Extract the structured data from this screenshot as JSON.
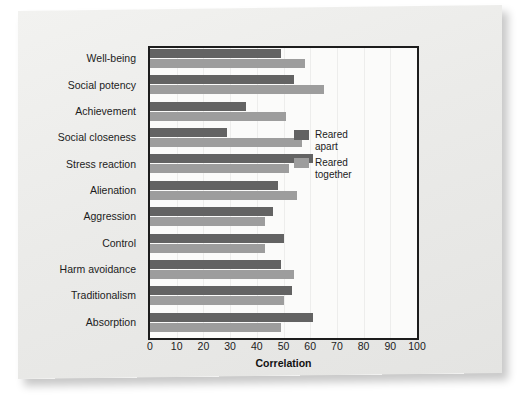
{
  "chart_data": {
    "type": "bar",
    "orientation": "horizontal",
    "title": "",
    "xlabel": "Correlation",
    "ylabel": "",
    "xlim": [
      0,
      100
    ],
    "xticks": [
      0,
      10,
      20,
      30,
      40,
      50,
      60,
      70,
      80,
      90,
      100
    ],
    "grid": true,
    "legend_position": "inside-right",
    "categories": [
      "Well-being",
      "Social potency",
      "Achievement",
      "Social closeness",
      "Stress reaction",
      "Alienation",
      "Aggression",
      "Control",
      "Harm avoidance",
      "Traditionalism",
      "Absorption"
    ],
    "series": [
      {
        "name": "Reared apart",
        "color": "#636363",
        "values": [
          49,
          54,
          36,
          29,
          61,
          48,
          46,
          50,
          49,
          53,
          61
        ]
      },
      {
        "name": "Reared together",
        "color": "#9d9d9d",
        "values": [
          58,
          65,
          51,
          57,
          52,
          55,
          43,
          43,
          54,
          50,
          49
        ]
      }
    ]
  },
  "legend": {
    "items": [
      {
        "label": "Reared apart",
        "color": "#636363"
      },
      {
        "label": "Reared together",
        "color": "#9d9d9d"
      }
    ]
  }
}
